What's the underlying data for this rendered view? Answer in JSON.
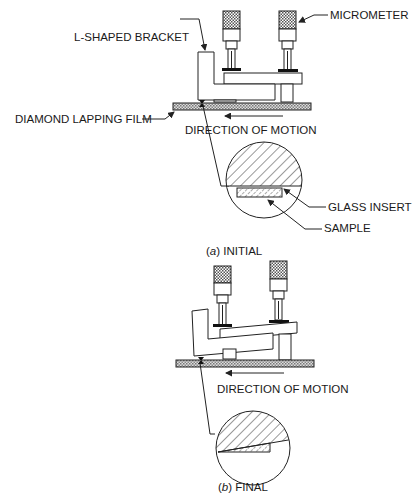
{
  "labels": {
    "micrometer": "MICROMETER",
    "l_shaped_bracket": "L-SHAPED BRACKET",
    "diamond_lapping_film": "DIAMOND LAPPING FILM",
    "direction_of_motion_a": "DIRECTION OF MOTION",
    "glass_insert": "GLASS INSERT",
    "sample": "SAMPLE",
    "direction_of_motion_b": "DIRECTION OF MOTION"
  },
  "captions": {
    "a_letter": "a",
    "a_text": " INITIAL",
    "b_letter": "b",
    "b_text": " FINAL"
  },
  "colors": {
    "line": "#222222",
    "background": "#ffffff"
  }
}
